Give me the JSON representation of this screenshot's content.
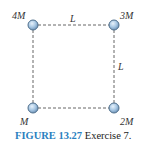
{
  "diagram": {
    "type": "square mass configuration",
    "masses": [
      {
        "label": "4M",
        "position": "top-left"
      },
      {
        "label": "3M",
        "position": "top-right"
      },
      {
        "label": "M",
        "position": "bottom-left"
      },
      {
        "label": "2M",
        "position": "bottom-right"
      }
    ],
    "side_labels": {
      "top": "L",
      "right": "L"
    },
    "colors": {
      "mass_fill": "#a9c8e4",
      "mass_stroke": "#4f6f8c",
      "edge": "#666666",
      "caption_accent": "#2a7fc0"
    }
  },
  "caption": {
    "figure_number": "FIGURE 13.27",
    "text": "Exercise 7."
  }
}
